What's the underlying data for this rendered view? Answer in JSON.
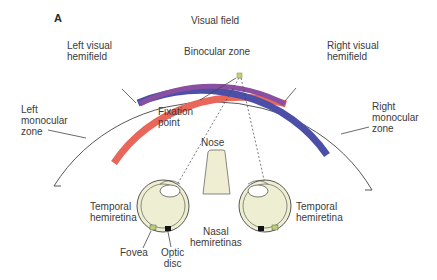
{
  "panel_label": "A",
  "labels": {
    "visual_field": "Visual field",
    "binocular_zone": "Binocular zone",
    "left_visual_hemifield": "Left visual\nhemifield",
    "right_visual_hemifield": "Right visual\nhemifield",
    "left_monocular_zone": "Left\nmonocular\nzone",
    "right_monocular_zone": "Right\nmonocular\nzone",
    "fixation_point": "Fixation\npoint",
    "nose": "Nose",
    "temporal_hemiretina_left": "Temporal\nhemiretina",
    "temporal_hemiretina_right": "Temporal\nhemiretina",
    "nasal_hemiretinas": "Nasal\nhemiretinas",
    "fovea": "Fovea",
    "optic_disc": "Optic\ndisc"
  },
  "colors": {
    "left_field_band": "#e8675a",
    "right_field_band": "#4b4fa8",
    "binocular_overlap": "#8a4fa0",
    "fixation_point": "#c8d070",
    "eye_fill": "#eeeed2",
    "nose_fill": "#efeed3",
    "line": "#333333"
  }
}
